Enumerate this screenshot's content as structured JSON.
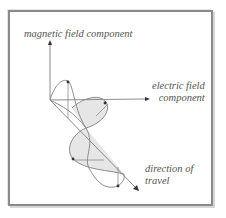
{
  "labels": {
    "magnetic": "magnetic field component",
    "electric_line1": "electric field",
    "electric_line2": "component",
    "direction_line1": "direction of",
    "direction_line2": "travel"
  },
  "colors": {
    "frame": "#8a8a8a",
    "lines": "#8c8c8c",
    "fill": "#e6e6e6",
    "text": "#555555"
  }
}
